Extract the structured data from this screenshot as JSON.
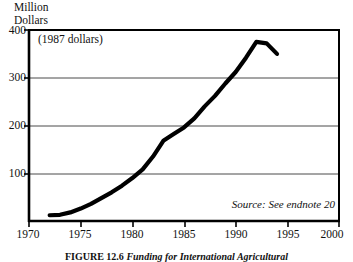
{
  "chart_data": {
    "type": "line",
    "title": "",
    "ylabel": "Million\nDollars",
    "xlabel": "",
    "annotation": "(1987 dollars)",
    "source": "Source: See endnote 20",
    "caption_label": "FIGURE 12.6",
    "caption_text": "Funding for International Agricultural",
    "xlim": [
      1970,
      2000
    ],
    "ylim": [
      0,
      400
    ],
    "grid": true,
    "gridlines_y": [
      100,
      200,
      300
    ],
    "legend": "none",
    "yticks": [
      {
        "value": 400,
        "label": "400"
      },
      {
        "value": 300,
        "label": "300"
      },
      {
        "value": 200,
        "label": "200"
      },
      {
        "value": 100,
        "label": "100"
      }
    ],
    "xticks": [
      {
        "value": 1970,
        "label": "1970"
      },
      {
        "value": 1975,
        "label": "1975"
      },
      {
        "value": 1980,
        "label": "1980"
      },
      {
        "value": 1985,
        "label": "1985"
      },
      {
        "value": 1990,
        "label": "1990"
      },
      {
        "value": 1995,
        "label": "1995"
      },
      {
        "value": 2000,
        "label": "2000"
      }
    ],
    "series": [
      {
        "name": "Funding",
        "color": "#000000",
        "x": [
          1972,
          1973,
          1974,
          1975,
          1976,
          1977,
          1978,
          1979,
          1980,
          1981,
          1982,
          1983,
          1984,
          1985,
          1986,
          1987,
          1988,
          1989,
          1990,
          1991,
          1992,
          1993,
          1994
        ],
        "values": [
          12,
          13,
          18,
          26,
          36,
          48,
          60,
          74,
          90,
          108,
          135,
          168,
          182,
          196,
          215,
          240,
          262,
          288,
          312,
          342,
          375,
          372,
          350
        ]
      }
    ]
  }
}
